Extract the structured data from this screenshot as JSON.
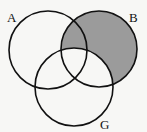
{
  "diagram": {
    "type": "venn",
    "sets": [
      {
        "label": "A",
        "cx": 48,
        "cy": 50,
        "r": 39,
        "label_x": 7,
        "label_y": 22
      },
      {
        "label": "B",
        "cx": 99,
        "cy": 49,
        "r": 38,
        "label_x": 129,
        "label_y": 22
      },
      {
        "label": "G",
        "cx": 74,
        "cy": 87,
        "r": 39,
        "label_x": 100,
        "label_y": 129
      }
    ],
    "shaded_region": "B minus G",
    "shade_color": "#9b9b9b",
    "stroke_color": "#111111",
    "background": "#f7f7f5"
  }
}
